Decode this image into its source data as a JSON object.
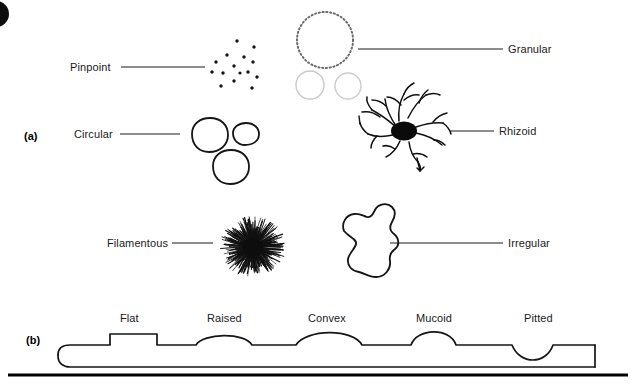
{
  "figure": {
    "background": "#ffffff",
    "ink": "#111111",
    "width": 636,
    "height": 385
  },
  "panels": [
    {
      "id": "a",
      "label": "(a)",
      "x": 24,
      "y": 130,
      "caption": "Colony form viewed from above"
    },
    {
      "id": "b",
      "label": "(b)",
      "x": 26,
      "y": 334,
      "caption": "Colony elevation viewed from the side"
    }
  ],
  "panel_a": {
    "items": [
      {
        "name": "pinpoint",
        "label": "Pinpoint",
        "label_x": 70,
        "label_y": 63,
        "label_align": "left",
        "leader": {
          "x1": 121,
          "y1": 67,
          "x2": 205,
          "y2": 67
        },
        "drawing": "scattered-dots"
      },
      {
        "name": "granular",
        "label": "Granular",
        "label_x": 508,
        "label_y": 45,
        "label_align": "left",
        "leader": {
          "x1": 358,
          "y1": 49,
          "x2": 503,
          "y2": 49
        },
        "drawing": "dotted-circles"
      },
      {
        "name": "circular",
        "label": "Circular",
        "label_x": 74,
        "label_y": 130,
        "label_align": "left",
        "leader": {
          "x1": 120,
          "y1": 134,
          "x2": 180,
          "y2": 134
        },
        "drawing": "round-colonies"
      },
      {
        "name": "rhizoid",
        "label": "Rhizoid",
        "label_x": 499,
        "label_y": 127,
        "label_align": "left",
        "leader": {
          "x1": 450,
          "y1": 131,
          "x2": 494,
          "y2": 131
        },
        "drawing": "branched-rhizoid"
      },
      {
        "name": "filamentous",
        "label": "Filamentous",
        "label_x": 107,
        "label_y": 239,
        "label_align": "left",
        "leader": {
          "x1": 172,
          "y1": 243,
          "x2": 213,
          "y2": 243
        },
        "drawing": "spiky-starburst"
      },
      {
        "name": "irregular",
        "label": "Irregular",
        "label_x": 508,
        "label_y": 239,
        "label_align": "left",
        "leader": {
          "x1": 390,
          "y1": 243,
          "x2": 503,
          "y2": 243
        },
        "drawing": "amoeboid-outline"
      }
    ]
  },
  "panel_b": {
    "elevations": [
      {
        "name": "flat",
        "label": "Flat",
        "label_x": 130,
        "label_y": 314,
        "profile": "rectangular-low-slab"
      },
      {
        "name": "raised",
        "label": "Raised",
        "label_x": 228,
        "label_y": 314,
        "profile": "rounded-shoulder-slab"
      },
      {
        "name": "convex",
        "label": "Convex",
        "label_x": 330,
        "label_y": 314,
        "profile": "broad-dome"
      },
      {
        "name": "mucoid",
        "label": "Mucoid",
        "label_x": 437,
        "label_y": 314,
        "profile": "tall-narrow-dome"
      },
      {
        "name": "pitted",
        "label": "Pitted",
        "label_x": 541,
        "label_y": 314,
        "profile": "semicircular-depression"
      }
    ],
    "agar_slab": {
      "x": 58,
      "y": 345,
      "width": 537,
      "height": 22,
      "note": "agar surface in cross-section"
    },
    "baseline_rule": {
      "x1": 8,
      "y1": 375,
      "x2": 628,
      "y2": 375,
      "thickness": 3
    }
  }
}
